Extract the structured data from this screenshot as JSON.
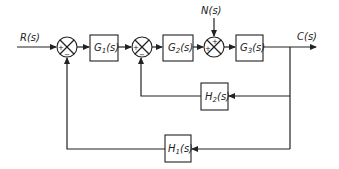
{
  "diagram": {
    "type": "control-system-block-diagram",
    "input": {
      "label": "R(s)"
    },
    "output": {
      "label": "C(s)"
    },
    "disturbance": {
      "label": "N(s)"
    },
    "blocks": [
      {
        "id": "G1",
        "label": "G1(s)",
        "name": "G",
        "sub": "1"
      },
      {
        "id": "G2",
        "label": "G2(s)",
        "name": "G",
        "sub": "2"
      },
      {
        "id": "G3",
        "label": "G3(s)",
        "name": "G",
        "sub": "3"
      },
      {
        "id": "H2",
        "label": "H2(s)",
        "name": "H",
        "sub": "2"
      },
      {
        "id": "H1",
        "label": "H1(s)",
        "name": "H",
        "sub": "1"
      }
    ],
    "summing_junctions": [
      {
        "id": "S1",
        "signs": {
          "left": "+",
          "bottom": "−"
        }
      },
      {
        "id": "S2",
        "signs": {
          "left": "+",
          "bottom": "−"
        }
      },
      {
        "id": "S3",
        "signs": {
          "top": "+",
          "left": "+"
        }
      }
    ],
    "paths": {
      "forward": [
        "R(s)",
        "S1",
        "G1",
        "S2",
        "G2",
        "S3",
        "G3",
        "C(s)"
      ],
      "disturbance": [
        "N(s)",
        "S3"
      ],
      "inner_feedback": [
        "C(s)",
        "H2",
        "S2"
      ],
      "outer_feedback": [
        "C(s)",
        "H1",
        "S1"
      ]
    },
    "text": {
      "R": "R(s)",
      "C": "C(s)",
      "N": "N(s)",
      "paren_s": "(s)",
      "plus": "+",
      "minus": "−"
    }
  }
}
